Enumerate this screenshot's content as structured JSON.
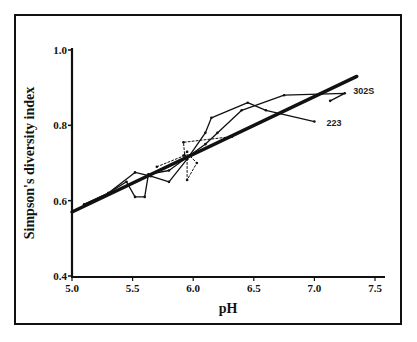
{
  "chart_data": {
    "type": "line",
    "title": "",
    "xlabel": "pH",
    "ylabel": "Simpson's diversity index",
    "xlim": [
      5.0,
      7.5
    ],
    "ylim": [
      0.4,
      1.0
    ],
    "x_ticks": [
      "5.0",
      "5.5",
      "6.0",
      "6.5",
      "7.0",
      "7.5"
    ],
    "y_ticks": [
      "0.4",
      "0.6",
      "0.8",
      "1.0"
    ],
    "grid": false,
    "legend": "none",
    "annotations": [
      {
        "text": "302S",
        "x": 7.32,
        "y": 0.89
      },
      {
        "text": "223",
        "x": 7.1,
        "y": 0.805
      }
    ],
    "series": [
      {
        "name": "Regression",
        "style": "thick-solid",
        "points": [
          [
            5.0,
            0.57
          ],
          [
            7.35,
            0.93
          ]
        ]
      },
      {
        "name": "223",
        "style": "solid",
        "points": [
          [
            5.1,
            0.59
          ],
          [
            5.3,
            0.62
          ],
          [
            5.52,
            0.675
          ],
          [
            5.65,
            0.665
          ],
          [
            5.8,
            0.65
          ],
          [
            5.95,
            0.71
          ],
          [
            6.1,
            0.78
          ],
          [
            6.15,
            0.82
          ],
          [
            6.45,
            0.86
          ],
          [
            6.6,
            0.84
          ],
          [
            7.0,
            0.81
          ]
        ]
      },
      {
        "name": "302S",
        "style": "solid",
        "points": [
          [
            5.1,
            0.59
          ],
          [
            5.3,
            0.62
          ],
          [
            5.45,
            0.65
          ],
          [
            5.52,
            0.61
          ],
          [
            5.6,
            0.61
          ],
          [
            5.63,
            0.67
          ],
          [
            5.8,
            0.68
          ],
          [
            5.97,
            0.72
          ],
          [
            6.1,
            0.75
          ],
          [
            6.2,
            0.78
          ],
          [
            6.4,
            0.84
          ],
          [
            6.75,
            0.88
          ],
          [
            7.25,
            0.885
          ],
          [
            7.13,
            0.865
          ]
        ]
      },
      {
        "name": "Dotted series",
        "style": "dotted",
        "points": [
          [
            5.7,
            0.69
          ],
          [
            5.93,
            0.72
          ],
          [
            5.92,
            0.755
          ],
          [
            6.32,
            0.77
          ]
        ]
      },
      {
        "name": "Dotted series B",
        "style": "dotted",
        "points": [
          [
            5.92,
            0.72
          ],
          [
            5.95,
            0.73
          ],
          [
            5.95,
            0.655
          ],
          [
            6.03,
            0.7
          ],
          [
            5.97,
            0.72
          ]
        ]
      }
    ]
  }
}
